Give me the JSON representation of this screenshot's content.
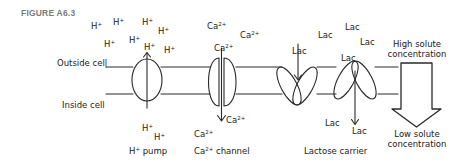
{
  "figure": {
    "label": "FIGURE A6.3"
  },
  "membrane": {
    "outside_label": "Outside cell",
    "inside_label": "Inside cell"
  },
  "h_pump": {
    "ion_base": "H",
    "ion_charge": "+",
    "caption_base": "H",
    "caption_charge": "+",
    "caption_rest": " pump",
    "outside_ions_count": 8,
    "inside_ions_count": 2
  },
  "ca_channel": {
    "ion_base": "Ca",
    "ion_charge": "2+",
    "caption_base": "Ca",
    "caption_charge": "2+",
    "caption_rest": " channel",
    "outside_ions_count": 3,
    "inside_ions_count": 2
  },
  "lactose_carrier": {
    "molecule": "Lac",
    "caption": "Lactose carrier",
    "outside_molecules_count": 5,
    "inside_molecules_count": 2
  },
  "gradient": {
    "high_line1": "High solute",
    "high_line2": "concentration",
    "low_line1": "Low solute",
    "low_line2": "concentration"
  },
  "colors": {
    "line": "#2a2a2a",
    "label_gray": "#7a7a7a",
    "background": "#ffffff"
  }
}
